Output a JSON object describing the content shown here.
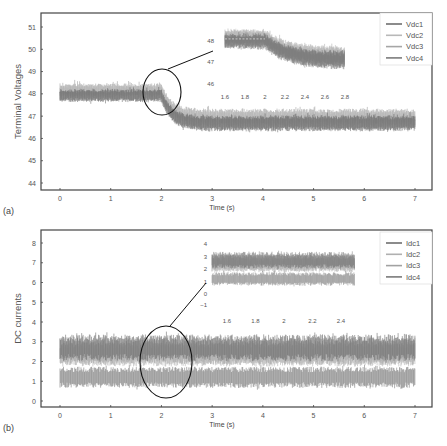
{
  "chart_data": [
    {
      "panel": "(a)",
      "type": "line",
      "title": "",
      "xlabel": "Time (s)",
      "ylabel": "Terminal Voltages",
      "xlim": [
        0,
        7
      ],
      "ylim": [
        44,
        51
      ],
      "xticks": [
        "0",
        "1",
        "2",
        "3",
        "4",
        "5",
        "6",
        "7"
      ],
      "yticks": [
        "44",
        "45",
        "46",
        "47",
        "48",
        "49",
        "50",
        "51"
      ],
      "grid": false,
      "legend_position": "upper right",
      "series": [
        {
          "name": "Vdc1",
          "color": "#6e6e6e",
          "before": [
            47.75,
            48.15
          ],
          "after": [
            46.45,
            46.95
          ]
        },
        {
          "name": "Vdc2",
          "color": "#b8b8b8",
          "before": [
            47.9,
            48.3
          ],
          "after": [
            46.6,
            47.1
          ]
        },
        {
          "name": "Vdc3",
          "color": "#a6a6a6",
          "before": [
            48.0,
            48.4
          ],
          "after": [
            46.75,
            47.25
          ]
        },
        {
          "name": "Vdc4",
          "color": "#7c7c7c",
          "before": [
            47.7,
            48.1
          ],
          "after": [
            46.4,
            46.9
          ]
        }
      ],
      "step_time": 2.0,
      "settle_time": 2.6,
      "annotation": {
        "type": "zoom-circle",
        "center_time": 2.0,
        "center_value": 48.0
      },
      "inset": {
        "xlim": [
          1.6,
          2.8
        ],
        "ylim": [
          46,
          48
        ],
        "xticks": [
          "1.6",
          "1.8",
          "2",
          "2.2",
          "2.4",
          "2.6",
          "2.8"
        ],
        "yticks": [
          "46",
          "47",
          "48"
        ],
        "before_level": [
          47.8,
          48.3
        ],
        "after_level": [
          46.9,
          47.5
        ]
      }
    },
    {
      "panel": "(b)",
      "type": "line",
      "title": "",
      "xlabel": "Time (s)",
      "ylabel": "DC currents",
      "xlim": [
        0,
        7
      ],
      "ylim": [
        0,
        8
      ],
      "xticks": [
        "0",
        "1",
        "2",
        "3",
        "4",
        "5",
        "6",
        "7"
      ],
      "yticks": [
        "0",
        "1",
        "2",
        "3",
        "4",
        "5",
        "6",
        "7",
        "8"
      ],
      "grid": false,
      "legend_position": "upper right",
      "series": [
        {
          "name": "Idc1",
          "color": "#6e6e6e",
          "band": [
            2.2,
            3.2
          ]
        },
        {
          "name": "Idc2",
          "color": "#b0b0b0",
          "band": [
            1.9,
            2.8
          ]
        },
        {
          "name": "Idc3",
          "color": "#a2a2a2",
          "band": [
            2.0,
            3.0
          ]
        },
        {
          "name": "Idc4",
          "color": "#7a7a7a",
          "band": [
            0.8,
            1.6
          ]
        }
      ],
      "annotation": {
        "type": "zoom-circle",
        "center_time": 2.1,
        "center_value": 2.0
      },
      "inset": {
        "xlim": [
          1.5,
          2.5
        ],
        "ylim": [
          -1,
          4
        ],
        "xticks": [
          "1.6",
          "1.8",
          "2",
          "2.2",
          "2.4"
        ],
        "yticks": [
          "-1",
          "0",
          "1",
          "2",
          "3",
          "4"
        ]
      }
    }
  ]
}
